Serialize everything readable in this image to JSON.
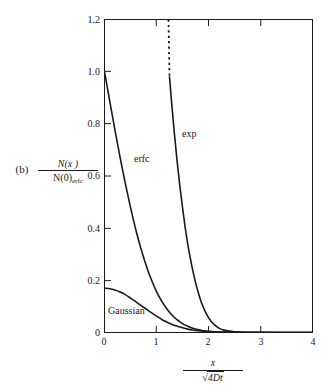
{
  "panel": {
    "letter": "(b)"
  },
  "axis_labels": {
    "y_numerator": "N(x )",
    "y_denominator_main": "N(0)",
    "y_denominator_sub": "erfc",
    "x_numerator": "x",
    "x_radical": "√",
    "x_denominator_inner": "4Dt"
  },
  "curve_labels": {
    "erfc": "erfc",
    "exp": "exp",
    "gaussian": "Gaussian"
  },
  "chart_data": {
    "type": "line",
    "title": "",
    "subtitle": "",
    "xlabel": "x / sqrt(4Dt)",
    "ylabel": "N(x) / N(0)_erfc",
    "xlim": [
      0,
      4
    ],
    "ylim": [
      0,
      1.2
    ],
    "xticks": [
      0,
      1,
      2,
      3,
      4
    ],
    "yticks": [
      0,
      0.2,
      0.4,
      0.6,
      0.8,
      1.0,
      1.2
    ],
    "xtick_labels": [
      "0",
      "1",
      "2",
      "3",
      "4"
    ],
    "ytick_labels": [
      "0",
      "0.2",
      "0.4",
      "0.6",
      "0.8",
      "1.0",
      "1.2"
    ],
    "grid": false,
    "legend": "none (curves labeled inline)",
    "annotations": [
      {
        "text": "erfc",
        "x": 0.58,
        "y": 0.62
      },
      {
        "text": "exp",
        "x": 1.5,
        "y": 0.72
      },
      {
        "text": "Gaussian",
        "x": 0.1,
        "y": 0.085
      }
    ],
    "series": [
      {
        "name": "erfc",
        "style": "solid",
        "color": "#1a1a1a",
        "x": [
          0.0,
          0.1,
          0.2,
          0.3,
          0.4,
          0.5,
          0.6,
          0.7,
          0.8,
          0.9,
          1.0,
          1.1,
          1.2,
          1.3,
          1.4,
          1.5,
          1.6,
          1.7,
          1.8,
          1.9,
          2.0,
          2.1,
          2.2,
          2.4,
          2.6,
          3.0,
          3.5,
          4.0
        ],
        "y": [
          1.0,
          0.888,
          0.777,
          0.671,
          0.572,
          0.48,
          0.396,
          0.322,
          0.258,
          0.203,
          0.157,
          0.12,
          0.09,
          0.066,
          0.048,
          0.034,
          0.024,
          0.016,
          0.011,
          0.007,
          0.005,
          0.003,
          0.002,
          0.001,
          0.0004,
          0.0001,
          0.0,
          0.0
        ]
      },
      {
        "name": "exp",
        "style": "solid-with-dotted-extension",
        "color": "#1a1a1a",
        "dotted_range": [
          1.205,
          1.25
        ],
        "dotted_note": "vertical dotted segment from y=1.2 down to y≈0.98 at x≈1.25",
        "x": [
          1.25,
          1.3,
          1.35,
          1.4,
          1.45,
          1.5,
          1.55,
          1.6,
          1.65,
          1.7,
          1.75,
          1.8,
          1.85,
          1.9,
          1.95,
          2.0,
          2.05,
          2.1,
          2.2,
          2.3,
          2.5,
          3.0,
          4.0
        ],
        "y": [
          0.98,
          0.86,
          0.75,
          0.65,
          0.56,
          0.48,
          0.405,
          0.34,
          0.285,
          0.235,
          0.192,
          0.155,
          0.123,
          0.097,
          0.075,
          0.057,
          0.043,
          0.032,
          0.017,
          0.009,
          0.003,
          0.0005,
          0.0
        ]
      },
      {
        "name": "Gaussian",
        "style": "solid",
        "color": "#1a1a1a",
        "peak_value": 0.17,
        "x": [
          0.0,
          0.1,
          0.2,
          0.3,
          0.4,
          0.5,
          0.6,
          0.7,
          0.8,
          0.9,
          1.0,
          1.1,
          1.2,
          1.3,
          1.4,
          1.5,
          1.6,
          1.7,
          1.8,
          1.9,
          2.0,
          2.2,
          2.4,
          2.8,
          3.2,
          4.0
        ],
        "y": [
          0.17,
          0.168,
          0.163,
          0.155,
          0.145,
          0.132,
          0.118,
          0.104,
          0.09,
          0.076,
          0.063,
          0.05,
          0.04,
          0.031,
          0.024,
          0.018,
          0.013,
          0.0095,
          0.0067,
          0.0046,
          0.0031,
          0.0014,
          0.0006,
          0.0001,
          0.0,
          0.0
        ]
      }
    ]
  }
}
